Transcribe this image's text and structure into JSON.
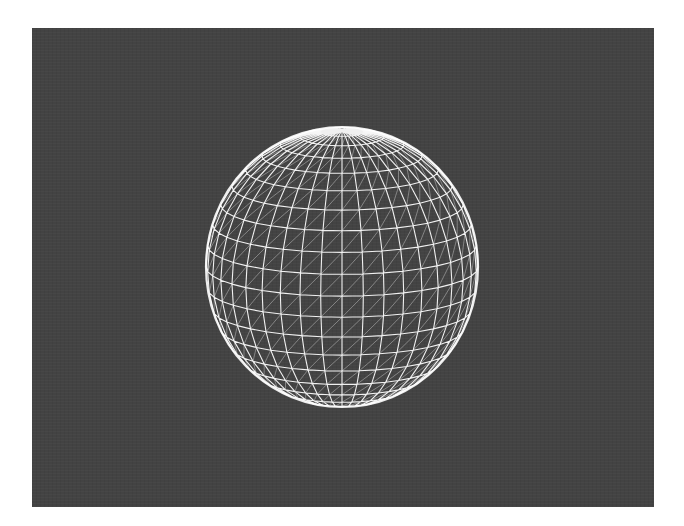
{
  "scene": {
    "background_color": "#434343",
    "frame_color": "#ffffff",
    "object": {
      "type": "uv-sphere-wireframe",
      "wire_color": "#ffffff",
      "diagonal_color": "#d8d8d8",
      "center": [
        310,
        239
      ],
      "radius_x": 136,
      "radius_y": 140,
      "segments": 40,
      "rings": 20,
      "tilt_deg": 12,
      "triangulated": true
    }
  }
}
